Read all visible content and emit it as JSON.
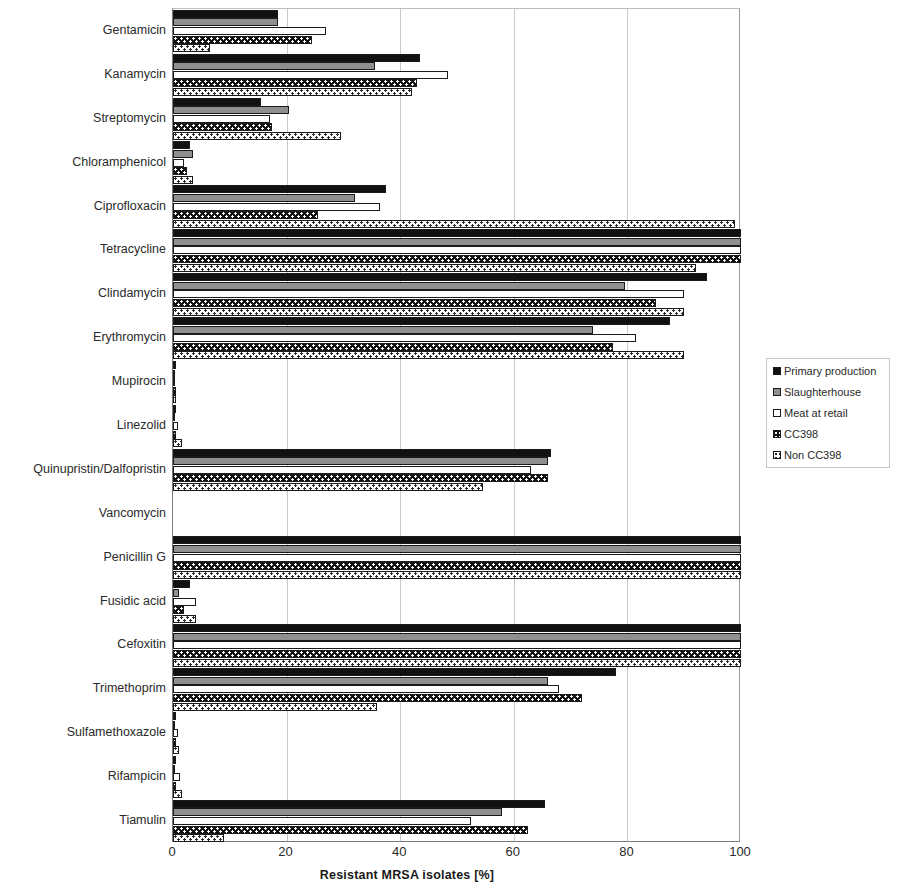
{
  "chart_data": {
    "type": "bar",
    "orientation": "horizontal",
    "title": "",
    "xlabel": "Resistant MRSA isolates [%]",
    "ylabel": "",
    "xlim": [
      0,
      100
    ],
    "xticks": [
      0,
      20,
      40,
      60,
      80,
      100
    ],
    "grid": "vertical",
    "legend_position": "right",
    "categories": [
      "Gentamicin",
      "Kanamycin",
      "Streptomycin",
      "Chloramphenicol",
      "Ciprofloxacin",
      "Tetracycline",
      "Clindamycin",
      "Erythromycin",
      "Mupirocin",
      "Linezolid",
      "Quinupristin/Dalfopristin",
      "Vancomycin",
      "Penicillin G",
      "Fusidic acid",
      "Cefoxitin",
      "Trimethoprim",
      "Sulfamethoxazole",
      "Rifampicin",
      "Tiamulin"
    ],
    "series": [
      {
        "name": "Primary production",
        "color": "#111111",
        "pattern": "solid-black",
        "values": [
          18.4,
          43.5,
          15.5,
          3.0,
          37.5,
          100,
          94.0,
          87.5,
          0.5,
          0.5,
          66.5,
          0,
          100,
          3.0,
          100,
          78.0,
          0.5,
          0.5,
          65.5
        ]
      },
      {
        "name": "Slaughterhouse",
        "color": "#8f8f8f",
        "pattern": "solid-gray",
        "values": [
          18.4,
          35.5,
          20.5,
          3.5,
          32.0,
          100,
          79.5,
          74.0,
          0.4,
          0.4,
          66.0,
          0,
          100,
          1.0,
          100,
          66.0,
          0.4,
          0.4,
          58.0
        ]
      },
      {
        "name": "Meat at retail",
        "color": "#ffffff",
        "pattern": "white",
        "values": [
          27.0,
          48.5,
          17.0,
          2.0,
          36.5,
          100,
          90.0,
          81.5,
          0.3,
          0.8,
          63.0,
          0,
          100,
          4.0,
          100,
          68.0,
          0.8,
          1.2,
          52.5
        ]
      },
      {
        "name": "CC398",
        "color": "#111111",
        "pattern": "black-dotted",
        "values": [
          24.5,
          43.0,
          17.5,
          2.5,
          25.5,
          100,
          85.0,
          77.5,
          0.5,
          0.5,
          66.0,
          0,
          100,
          2.0,
          100,
          72.0,
          0.5,
          0.5,
          62.5
        ]
      },
      {
        "name": "Non CC398",
        "color": "#ffffff",
        "pattern": "white-dotted",
        "values": [
          6.5,
          42.0,
          29.5,
          3.5,
          99.0,
          92.0,
          90.0,
          90.0,
          0.6,
          1.5,
          54.5,
          0,
          100,
          4.0,
          100,
          36.0,
          1.0,
          1.5,
          9.0
        ]
      }
    ]
  },
  "legend": {
    "items": [
      {
        "label": "Primary production"
      },
      {
        "label": "Slaughterhouse"
      },
      {
        "label": "Meat at retail"
      },
      {
        "label": "CC398"
      },
      {
        "label": "Non CC398"
      }
    ]
  }
}
